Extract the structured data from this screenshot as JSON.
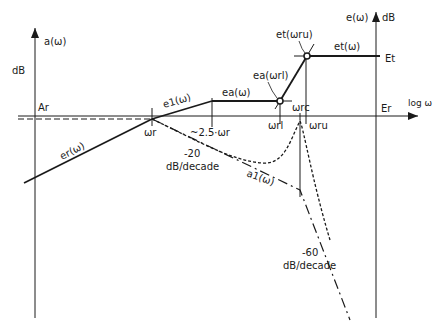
{
  "diagram": {
    "type": "bode-style asymptotic diagram",
    "axes": {
      "left_axis_label": "a(ω)",
      "left_axis_unit": "dB",
      "right_axis_label": "e(ω)",
      "right_axis_unit": "dB",
      "horizontal_axis_label": "log ω",
      "left_reference": "Ar",
      "right_reference": "Er",
      "top_level": "Et"
    },
    "frequency_marks": {
      "omega_r": "ωr",
      "omega_2_5": "~2.5·ωr",
      "omega_rl": "ωrl",
      "omega_rc": "ωrc",
      "omega_ru": "ωru"
    },
    "curve_labels": {
      "er": "er(ω)",
      "e1": "e1(ω)",
      "ea": "ea(ω)",
      "et": "et(ω)",
      "ea_at_rl": "ea(ωrl)",
      "et_at_ru": "et(ωru)",
      "a1": "a1(ω)"
    },
    "slope_annotations": {
      "slope_20": "-20",
      "slope_20_unit": "dB/decade",
      "slope_60": "-60",
      "slope_60_unit": "dB/decade"
    },
    "colors": {
      "ink": "#1a1a1a",
      "background": "#ffffff"
    }
  }
}
